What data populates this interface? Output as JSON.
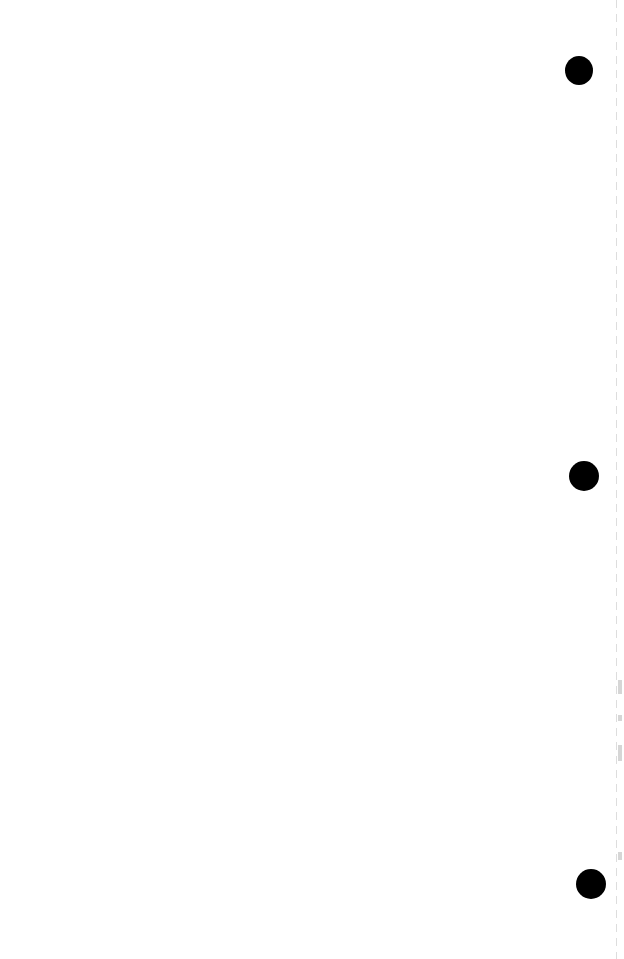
{
  "page": {
    "type": "blank scanned page",
    "punch_holes": [
      {
        "x": 579,
        "y": 70,
        "d": 28
      },
      {
        "x": 584,
        "y": 476,
        "d": 30
      },
      {
        "x": 591,
        "y": 884,
        "d": 30
      }
    ],
    "colors": {
      "background": "#ffffff",
      "hole": "#000000"
    }
  }
}
